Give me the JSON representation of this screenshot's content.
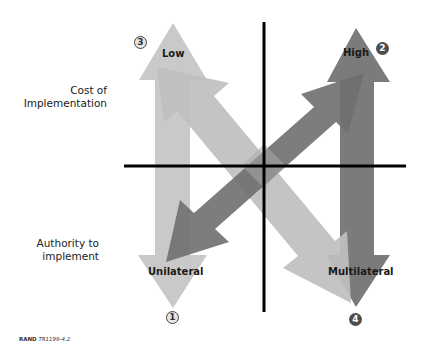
{
  "figure": {
    "axis_labels": {
      "vertical_top": "Cost of Implementation",
      "vertical_top_line1": "Cost of",
      "vertical_top_line2": "Implementation",
      "vertical_bottom_line1": "Authority to",
      "vertical_bottom_line2": "implement"
    },
    "arrows": [
      {
        "id": "left-vertical",
        "shade": "light",
        "color": "#c9c9c9",
        "top_label": "Low",
        "bottom_label": "Unilateral",
        "top_number": "3",
        "bottom_number": "1"
      },
      {
        "id": "right-vertical",
        "shade": "dark",
        "color": "#7b7b7b",
        "top_label": "High",
        "bottom_label": "Multilateral",
        "top_number": "2",
        "bottom_number": "4"
      },
      {
        "id": "diagonal-light",
        "shade": "light",
        "color": "#bfbfbf",
        "direction": "top-left to bottom-right"
      },
      {
        "id": "diagonal-dark",
        "shade": "dark",
        "color": "#6f6f6f",
        "direction": "bottom-left to top-right"
      }
    ],
    "labels": {
      "low": "Low",
      "high": "High",
      "unilateral": "Unilateral",
      "multilateral": "Multilateral"
    },
    "numbers": {
      "n1": "1",
      "n2": "2",
      "n3": "3",
      "n4": "4"
    },
    "colors": {
      "axis": "#000000",
      "light_arrow": "#c9c9c9",
      "dark_arrow": "#7b7b7b",
      "diag_light": "#bfbfbf",
      "diag_dark": "#6f6f6f"
    },
    "credit": {
      "org": "RAND",
      "id": "TR1199-4.2"
    }
  }
}
